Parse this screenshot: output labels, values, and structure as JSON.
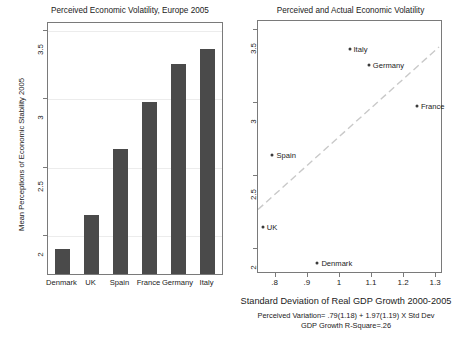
{
  "figure": {
    "background": "#ffffff",
    "bar_color": "#4a4a4a",
    "marker_color": "#3a3a3a",
    "fitline_color": "#c9c9c9",
    "axis_color": "#7a7a7a"
  },
  "left": {
    "title": "Perceived Economic Volatility, Europe 2005",
    "ylabel": "Mean Perceptions of Economic Stability 2005",
    "yticks": [
      "2",
      "2.5",
      "3",
      "3.5"
    ],
    "categories": [
      "Denmark",
      "UK",
      "Spain",
      "France",
      "Germany",
      "Italy"
    ]
  },
  "right": {
    "title": "Perceived and Actual Economic Volatility",
    "xlabel": "Standard Deviation of Real GDP Growth 2000-2005",
    "caption_line1": "Perceived Variation= .79(1.18) + 1.97(1.19) X Std Dev",
    "caption_line2": "GDP Growth R-Square=.26",
    "yticks": [
      "2",
      "2.5",
      "3",
      "3.5"
    ],
    "xticks": [
      ".8",
      ".9",
      "1",
      "1.1",
      "1.2",
      "1.3"
    ],
    "point_labels": [
      "Italy",
      "Germany",
      "France",
      "Spain",
      "UK",
      "Denmark"
    ]
  },
  "chart_data": [
    {
      "type": "bar",
      "title": "Perceived Economic Volatility, Europe 2005",
      "xlabel": "",
      "ylabel": "Mean Perceptions of Economic Stability 2005",
      "categories": [
        "Denmark",
        "UK",
        "Spain",
        "France",
        "Germany",
        "Italy"
      ],
      "values": [
        1.9,
        2.15,
        2.64,
        2.98,
        3.26,
        3.37
      ],
      "ylim": [
        1.72,
        3.56
      ],
      "yticks": [
        2,
        2.5,
        3,
        3.5
      ],
      "grid": true,
      "legend": "none",
      "bar_color": "#4a4a4a"
    },
    {
      "type": "scatter",
      "title": "Perceived and Actual Economic Volatility",
      "xlabel": "Standard Deviation of Real GDP Growth 2000-2005",
      "ylabel": "",
      "xlim": [
        0.745,
        1.315
      ],
      "ylim": [
        1.84,
        3.56
      ],
      "xticks": [
        0.8,
        0.9,
        1.0,
        1.1,
        1.2,
        1.3
      ],
      "yticks": [
        2,
        2.5,
        3,
        3.5
      ],
      "grid": false,
      "legend": "none",
      "points": [
        {
          "label": "Italy",
          "x": 1.03,
          "y": 3.37,
          "label_side": "right"
        },
        {
          "label": "Germany",
          "x": 1.09,
          "y": 3.26,
          "label_side": "right"
        },
        {
          "label": "France",
          "x": 1.24,
          "y": 2.98,
          "label_side": "right"
        },
        {
          "label": "Spain",
          "x": 0.79,
          "y": 2.64,
          "label_side": "right"
        },
        {
          "label": "UK",
          "x": 0.76,
          "y": 2.15,
          "label_side": "right"
        },
        {
          "label": "Denmark",
          "x": 0.93,
          "y": 1.9,
          "label_side": "right"
        }
      ],
      "fit_line": {
        "intercept": 0.79,
        "slope": 1.97,
        "intercept_se": 1.18,
        "slope_se": 1.19,
        "r_square": 0.26,
        "equation": "Perceived Variation= .79(1.18) + 1.97(1.19) X Std Dev",
        "style": "dashed",
        "color": "#c9c9c9"
      },
      "annotations": [
        "Perceived Variation= .79(1.18) + 1.97(1.19) X Std Dev",
        "GDP Growth R-Square=.26"
      ]
    }
  ]
}
